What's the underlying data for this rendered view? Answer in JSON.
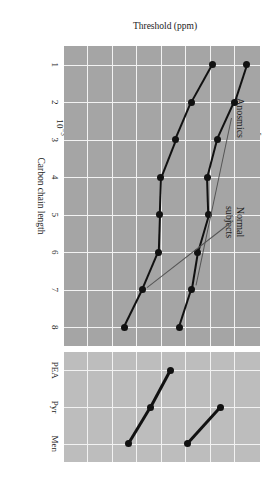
{
  "chart_data": {
    "type": "line",
    "title": "",
    "xlabel": "Carbon chain length",
    "ylabel": "Threshold (ppm)",
    "ylim": [
      -3,
      5
    ],
    "ytick_labels": [
      "10⁵",
      "10⁴",
      "10³",
      "10²",
      "10¹",
      "10⁰",
      "10⁻¹",
      "10⁻²",
      "10⁻³"
    ],
    "ytick_mantissa": [
      "10",
      "10",
      "10",
      "10",
      "10",
      "10",
      "10",
      "10",
      "10"
    ],
    "ytick_exponent": [
      "5",
      "4",
      "3",
      "2",
      "1",
      "0",
      "-1",
      "-2",
      "-3"
    ],
    "ytick_log_values": [
      5,
      4,
      3,
      2,
      1,
      0,
      -1,
      -2,
      -3
    ],
    "grid": true,
    "legend": "annotations",
    "x": [
      1,
      2,
      3,
      4,
      5,
      6,
      7,
      8
    ],
    "xtick_labels": [
      "1",
      "2",
      "3",
      "4",
      "5",
      "6",
      "7",
      "8"
    ],
    "series": [
      {
        "name": "Anosmics",
        "log_values": [
          4.45,
          3.95,
          3.25,
          2.85,
          2.9,
          2.45,
          2.2,
          1.7
        ]
      },
      {
        "name": "Normal subjects",
        "log_values": [
          3.05,
          2.2,
          1.55,
          0.95,
          0.9,
          0.85,
          0.2,
          -0.55
        ]
      }
    ],
    "categorical_panel": {
      "categories": [
        "PEA",
        "Pyr",
        "Men"
      ],
      "series": [
        {
          "name": "Anosmics",
          "log_values": [
            null,
            3.4,
            2.05
          ]
        },
        {
          "name": "Normal subjects",
          "log_values": [
            1.35,
            0.55,
            -0.35
          ]
        }
      ]
    },
    "annotations": [
      {
        "id": "anosmics",
        "text_line1": "Anosmics",
        "text_line2": ""
      },
      {
        "id": "normal-subjects",
        "text_line1": "Normal",
        "text_line2": "subjects"
      }
    ]
  },
  "colors": {
    "panel_main_bg": "#a5a5a5",
    "panel_cat_bg": "#bdbdbd",
    "gridline": "#f2f2f2",
    "marker": "#111111",
    "line": "#111111",
    "leader": "#555555",
    "text": "#1a1a1a",
    "page_bg": "#ffffff"
  }
}
